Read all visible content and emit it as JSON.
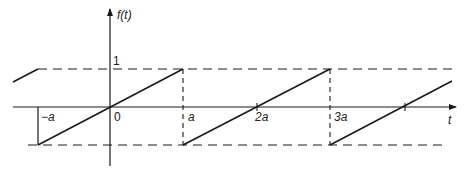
{
  "diagram": {
    "y_axis_label": "f(t)",
    "x_axis_label": "t",
    "level_labels": {
      "top": "1"
    },
    "tick_labels": {
      "neg_a": "−a",
      "zero": "0",
      "a": "a",
      "two_a": "2a",
      "three_a": "3a"
    },
    "colors": {
      "stroke": "#1a1a1a",
      "background": "#ffffff"
    },
    "function": {
      "type": "sawtooth",
      "period": "2a",
      "amplitude": 1,
      "description": "Linear ramp from -1 at t=(2k-1)a to +1 at t=(2k+1)a, jumping back to -1"
    }
  }
}
